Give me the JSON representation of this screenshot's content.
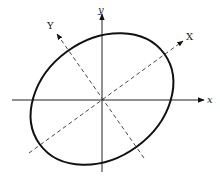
{
  "diagram": {
    "type": "rotated-ellipse-coordinate-axes",
    "labels": {
      "x_axis": "x",
      "y_axis": "y",
      "rotated_x_axis": "X",
      "rotated_y_axis": "Y"
    },
    "colors": {
      "stroke": "#111111",
      "background": "#ffffff"
    }
  }
}
